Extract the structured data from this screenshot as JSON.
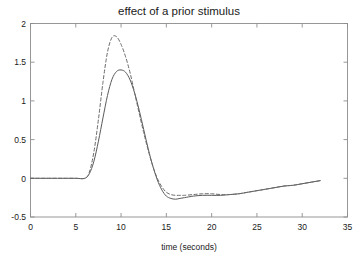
{
  "chart_data": {
    "type": "line",
    "title": "effect of a prior stimulus",
    "xlabel": "time (seconds)",
    "ylabel": "",
    "xlim": [
      0,
      35
    ],
    "ylim": [
      -0.5,
      2
    ],
    "grid": false,
    "legend_position": "none",
    "xticks": [
      "0",
      "5",
      "10",
      "15",
      "20",
      "25",
      "30",
      "35"
    ],
    "xtick_values": [
      0,
      5,
      10,
      15,
      20,
      25,
      30,
      35
    ],
    "yticks": [
      "2",
      "1.5",
      "1",
      "0.5",
      "0",
      "-0.5"
    ],
    "ytick_values": [
      2,
      1.5,
      1,
      0.5,
      0,
      -0.5
    ],
    "x": [
      0,
      1,
      2,
      3,
      4,
      5,
      6,
      6.5,
      7,
      7.5,
      8,
      8.5,
      9,
      9.5,
      10,
      10.5,
      11,
      11.5,
      12,
      12.5,
      13,
      13.5,
      14,
      14.5,
      15,
      15.5,
      16,
      16.5,
      17,
      18,
      19,
      20,
      21,
      22,
      23,
      24,
      25,
      26,
      27,
      28,
      29,
      30,
      31,
      32
    ],
    "series": [
      {
        "name": "single stimulus response",
        "style": "solid",
        "color": "#5a5a5a",
        "values": [
          0,
          0,
          0,
          0,
          0,
          0,
          0,
          0.06,
          0.22,
          0.48,
          0.78,
          1.07,
          1.28,
          1.38,
          1.4,
          1.37,
          1.27,
          1.1,
          0.88,
          0.63,
          0.38,
          0.16,
          -0.02,
          -0.15,
          -0.23,
          -0.26,
          -0.27,
          -0.26,
          -0.25,
          -0.23,
          -0.22,
          -0.22,
          -0.22,
          -0.21,
          -0.2,
          -0.18,
          -0.16,
          -0.14,
          -0.12,
          -0.1,
          -0.09,
          -0.07,
          -0.05,
          -0.03
        ]
      },
      {
        "name": "response following a prior stimulus",
        "style": "dashed",
        "color": "#6a6a6a",
        "values": [
          0,
          0,
          0,
          0,
          0,
          0,
          0,
          0.08,
          0.34,
          0.76,
          1.24,
          1.63,
          1.82,
          1.83,
          1.73,
          1.57,
          1.36,
          1.1,
          0.84,
          0.59,
          0.36,
          0.16,
          0.0,
          -0.11,
          -0.18,
          -0.21,
          -0.22,
          -0.22,
          -0.22,
          -0.21,
          -0.2,
          -0.2,
          -0.21,
          -0.21,
          -0.2,
          -0.18,
          -0.16,
          -0.14,
          -0.12,
          -0.1,
          -0.09,
          -0.07,
          -0.05,
          -0.03
        ]
      }
    ],
    "annotations": []
  },
  "figure": {
    "background_color": "#ffffff",
    "axis_color": "#8d8d8d",
    "text_color": "#1a1a1a"
  }
}
